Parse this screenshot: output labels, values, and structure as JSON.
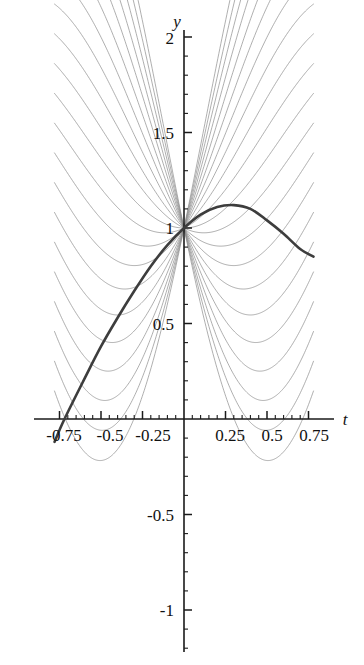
{
  "chart_data": {
    "type": "line",
    "title": "",
    "subtitle": "",
    "xlabel": "t",
    "ylabel": "y",
    "xlim": [
      -0.8,
      0.8
    ],
    "ylim": [
      -1.25,
      2.05
    ],
    "grid": false,
    "legend": "none",
    "annotations": [],
    "axis": {
      "x_axis_label": "t",
      "y_axis_label": "y",
      "x_major_ticks": [
        -0.75,
        -0.5,
        -0.25,
        0.25,
        0.5,
        0.75
      ],
      "x_major_tick_labels": [
        "-0.75",
        "-0.5",
        "-0.25",
        "0.25",
        "0.5",
        "0.75"
      ],
      "y_major_ticks": [
        -1,
        -0.5,
        0.5,
        1,
        1.5,
        2
      ],
      "y_major_tick_labels": [
        "-1",
        "-0.5",
        "0.5",
        "1",
        "1.5",
        "2"
      ],
      "x_minor_step": 0.05,
      "y_minor_step": 0.1,
      "x_tick_min": -0.75,
      "x_tick_max": 0.75,
      "y_tick_min": -1.2,
      "y_tick_max": 2.0,
      "axes_color": "#1a1a1a"
    },
    "common_point": {
      "t": 0.0,
      "y": 1.0
    },
    "family": {
      "description": "family of solution curves through (0,1)",
      "color": "#8c8c8c",
      "line_width": 0.7,
      "count": 21,
      "slope_min": -4.2,
      "slope_max": 4.2,
      "t_min": -0.78,
      "t_max": 0.78
    },
    "highlighted_curve": {
      "color": "#3d3d3d",
      "line_width": 2.6,
      "slope": 1.35,
      "t_min": -0.78,
      "t_max": 0.78,
      "points": [
        {
          "t": -0.78,
          "y": -0.12
        },
        {
          "t": -0.72,
          "y": 0.0
        },
        {
          "t": -0.6,
          "y": 0.21
        },
        {
          "t": -0.5,
          "y": 0.38
        },
        {
          "t": -0.4,
          "y": 0.53
        },
        {
          "t": -0.3,
          "y": 0.67
        },
        {
          "t": -0.2,
          "y": 0.8
        },
        {
          "t": -0.1,
          "y": 0.91
        },
        {
          "t": 0.0,
          "y": 1.0
        },
        {
          "t": 0.1,
          "y": 1.07
        },
        {
          "t": 0.2,
          "y": 1.11
        },
        {
          "t": 0.3,
          "y": 1.12
        },
        {
          "t": 0.4,
          "y": 1.1
        },
        {
          "t": 0.5,
          "y": 1.04
        },
        {
          "t": 0.6,
          "y": 0.97
        },
        {
          "t": 0.7,
          "y": 0.89
        },
        {
          "t": 0.78,
          "y": 0.85
        }
      ]
    }
  },
  "labels": {
    "y_axis": "y",
    "t_axis": "t",
    "x": {
      "n075": "-0.75",
      "n05": "-0.5",
      "n025": "-0.25",
      "p025": "0.25",
      "p05": "0.5",
      "p075": "0.75"
    },
    "y": {
      "p2": "2",
      "p15": "1.5",
      "p1": "1",
      "p05": "0.5",
      "n05": "-0.5",
      "n1": "-1"
    }
  }
}
